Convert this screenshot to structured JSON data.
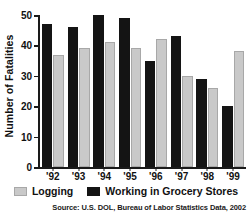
{
  "chart_data": {
    "type": "bar",
    "title": "",
    "xlabel": "",
    "ylabel": "Number of Fatalities",
    "categories": [
      "'92",
      "'93",
      "'94",
      "'95",
      "'96",
      "'97",
      "'98",
      "'99"
    ],
    "series": [
      {
        "name": "Logging",
        "color": "#c9c9c9",
        "values": [
          37,
          39,
          41,
          39,
          42,
          30,
          26,
          38
        ]
      },
      {
        "name": "Working in Grocery Stores",
        "color": "#141414",
        "values": [
          47,
          46,
          50,
          49,
          35,
          43,
          29,
          20
        ]
      }
    ],
    "series_order_in_group": [
      "Working in Grocery Stores",
      "Logging"
    ],
    "ylim": [
      0,
      50
    ],
    "yticks": [
      0,
      10,
      20,
      30,
      40,
      50
    ],
    "ytick_labels": [
      "0",
      "10",
      "20",
      "30",
      "40",
      "50"
    ],
    "grid": false,
    "legend_position": "bottom",
    "source_note": "Source: U.S. DOL, Bureau of Labor Statistics Data, 2002"
  },
  "legend": {
    "items": [
      {
        "label": "Logging"
      },
      {
        "label": "Working in Grocery Stores"
      }
    ]
  }
}
